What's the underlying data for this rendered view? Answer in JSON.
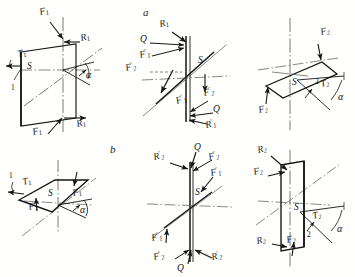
{
  "figure": {
    "type": "engineering-force-diagram",
    "rows": [
      {
        "id": "a",
        "label": "a"
      },
      {
        "id": "b",
        "label": "b"
      }
    ]
  },
  "colors": {
    "ink": "#141414",
    "axis": "#4a4a4a",
    "paper": "#ffffff"
  },
  "panels": [
    {
      "id": "a1",
      "row": "a",
      "labels": [
        {
          "key": "F1_top",
          "base": "F",
          "sub": "1",
          "prime": "",
          "text": "F1"
        },
        {
          "key": "R1_top",
          "base": "R",
          "sub": "1",
          "prime": "",
          "text": "R1"
        },
        {
          "key": "T1",
          "base": "T",
          "sub": "1",
          "prime": "",
          "text": "T1"
        },
        {
          "key": "S",
          "base": "S",
          "sub": "",
          "prime": "",
          "text": "S"
        },
        {
          "key": "one",
          "base": "1",
          "sub": "",
          "prime": "",
          "text": "1"
        },
        {
          "key": "alpha",
          "base": "α",
          "sub": "",
          "prime": "",
          "text": "α"
        },
        {
          "key": "F1_bot",
          "base": "F",
          "sub": "1",
          "prime": "",
          "text": "F1"
        },
        {
          "key": "R1_bot",
          "base": "R",
          "sub": "1",
          "prime": "",
          "text": "R1"
        }
      ]
    },
    {
      "id": "a2",
      "row": "a",
      "labels": [
        {
          "key": "R1",
          "base": "R",
          "sub": "1",
          "prime": "",
          "text": "R1"
        },
        {
          "key": "Q_top",
          "base": "Q",
          "sub": "",
          "prime": "",
          "text": "Q"
        },
        {
          "key": "F1p",
          "base": "F",
          "sub": "1",
          "prime": "'",
          "text": "F1'"
        },
        {
          "key": "S",
          "base": "S",
          "sub": "",
          "prime": "",
          "text": "S"
        },
        {
          "key": "F2p_l",
          "base": "F",
          "sub": "2",
          "prime": "'",
          "text": "F2'"
        },
        {
          "key": "F2p_r",
          "base": "F",
          "sub": "2",
          "prime": "'",
          "text": "F2'"
        },
        {
          "key": "F1p_b",
          "base": "F",
          "sub": "1",
          "prime": "'",
          "text": "F1'"
        },
        {
          "key": "Q_bot",
          "base": "Q",
          "sub": "",
          "prime": "",
          "text": "Q"
        },
        {
          "key": "R1p",
          "base": "R",
          "sub": "1",
          "prime": "'",
          "text": "R1'"
        }
      ]
    },
    {
      "id": "a3",
      "row": "a",
      "labels": [
        {
          "key": "F2_top",
          "base": "F",
          "sub": "2",
          "prime": "",
          "text": "F2"
        },
        {
          "key": "S",
          "base": "S",
          "sub": "",
          "prime": "",
          "text": "S"
        },
        {
          "key": "two",
          "base": "2",
          "sub": "",
          "prime": "",
          "text": "2"
        },
        {
          "key": "T2",
          "base": "T",
          "sub": "2",
          "prime": "",
          "text": "T2"
        },
        {
          "key": "alpha",
          "base": "α",
          "sub": "",
          "prime": "",
          "text": "α"
        },
        {
          "key": "F2_bot",
          "base": "F",
          "sub": "2",
          "prime": "",
          "text": "F2"
        }
      ]
    },
    {
      "id": "b1",
      "row": "b",
      "labels": [
        {
          "key": "one",
          "base": "1",
          "sub": "",
          "prime": "",
          "text": "1"
        },
        {
          "key": "T1",
          "base": "T",
          "sub": "1",
          "prime": "",
          "text": "T1"
        },
        {
          "key": "S",
          "base": "S",
          "sub": "",
          "prime": "",
          "text": "S"
        },
        {
          "key": "F1_l",
          "base": "F",
          "sub": "1",
          "prime": "",
          "text": "F1"
        },
        {
          "key": "F1_r",
          "base": "F",
          "sub": "1",
          "prime": "",
          "text": "F1"
        },
        {
          "key": "alpha",
          "base": "α",
          "sub": "",
          "prime": "",
          "text": "α"
        }
      ]
    },
    {
      "id": "b2",
      "row": "b",
      "labels": [
        {
          "key": "Q_top",
          "base": "Q",
          "sub": "",
          "prime": "",
          "text": "Q"
        },
        {
          "key": "R2p_t",
          "base": "R",
          "sub": "2",
          "prime": "'",
          "text": "R2'"
        },
        {
          "key": "F2p_t",
          "base": "F",
          "sub": "2",
          "prime": "'",
          "text": "F2'"
        },
        {
          "key": "F1p_t",
          "base": "F",
          "sub": "1",
          "prime": "'",
          "text": "F1'"
        },
        {
          "key": "S",
          "base": "S",
          "sub": "",
          "prime": "",
          "text": "S"
        },
        {
          "key": "F1p_b",
          "base": "F",
          "sub": "1",
          "prime": "'",
          "text": "F1'"
        },
        {
          "key": "F2p_b",
          "base": "F",
          "sub": "2",
          "prime": "'",
          "text": "F2'"
        },
        {
          "key": "Q_bot",
          "base": "Q",
          "sub": "",
          "prime": "",
          "text": "Q"
        },
        {
          "key": "R2p_b",
          "base": "R",
          "sub": "2",
          "prime": "'",
          "text": "R2'"
        }
      ]
    },
    {
      "id": "b3",
      "row": "b",
      "labels": [
        {
          "key": "R2_top",
          "base": "R",
          "sub": "2",
          "prime": "",
          "text": "R2"
        },
        {
          "key": "F2_top",
          "base": "F",
          "sub": "2",
          "prime": "",
          "text": "F2"
        },
        {
          "key": "S",
          "base": "S",
          "sub": "",
          "prime": "",
          "text": "S"
        },
        {
          "key": "T2",
          "base": "T",
          "sub": "2",
          "prime": "",
          "text": "T2"
        },
        {
          "key": "alpha",
          "base": "α",
          "sub": "",
          "prime": "",
          "text": "α"
        },
        {
          "key": "two",
          "base": "2",
          "sub": "",
          "prime": "",
          "text": "2"
        },
        {
          "key": "R2_bot",
          "base": "R",
          "sub": "2",
          "prime": "",
          "text": "R2"
        },
        {
          "key": "F2_bot",
          "base": "F",
          "sub": "2",
          "prime": "",
          "text": "F2"
        }
      ]
    }
  ],
  "text": {
    "row_a": "a",
    "row_b": "b",
    "F1": "F",
    "F2": "F",
    "R1": "R",
    "R2": "R",
    "T1": "T",
    "T2": "T",
    "Q": "Q",
    "S": "S",
    "one": "1",
    "two": "2",
    "alpha": "α",
    "sub1": "1",
    "sub2": "2",
    "prime": "′"
  }
}
